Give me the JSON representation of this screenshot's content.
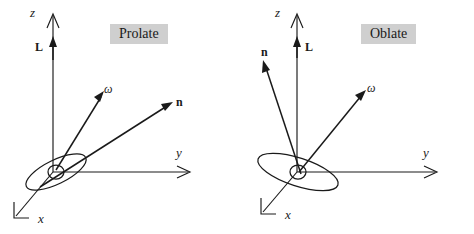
{
  "figure": {
    "background_color": "#ffffff",
    "stroke_color": "#1a1a1a",
    "title_box_color": "#cfcfcf"
  },
  "panels": [
    {
      "id": "prolate",
      "title": "Prolate",
      "axes": [
        {
          "name": "z",
          "label": "z"
        },
        {
          "name": "y",
          "label": "y"
        },
        {
          "name": "x",
          "label": "x"
        }
      ],
      "vectors": [
        {
          "name": "angular-momentum",
          "label": "L",
          "direction": "up along z"
        },
        {
          "name": "angular-velocity",
          "label": "ω",
          "direction": "up and slightly right"
        },
        {
          "name": "symmetry-axis",
          "label": "n",
          "direction": "up right, shallow"
        }
      ],
      "body": {
        "name": "prolate-spheroid",
        "shape": "elongated ellipse tilted with long axis along n"
      }
    },
    {
      "id": "oblate",
      "title": "Oblate",
      "axes": [
        {
          "name": "z",
          "label": "z"
        },
        {
          "name": "y",
          "label": "y"
        },
        {
          "name": "x",
          "label": "x"
        }
      ],
      "vectors": [
        {
          "name": "angular-momentum",
          "label": "L",
          "direction": "up along z"
        },
        {
          "name": "angular-velocity",
          "label": "ω",
          "direction": "up and right"
        },
        {
          "name": "symmetry-axis",
          "label": "n",
          "direction": "up left"
        }
      ],
      "body": {
        "name": "oblate-spheroid",
        "shape": "flattened ellipse tilted with short axis along n"
      }
    }
  ]
}
